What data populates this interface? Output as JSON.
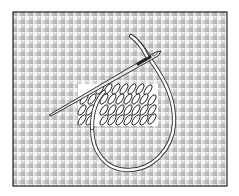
{
  "illustration": {
    "title": "Needlepoint tent stitch on canvas",
    "subject": "needle-and-thread-stitching-canvas",
    "colors": {
      "background": "#ffffff",
      "canvas_fill": "#f4f4f4",
      "mesh_line": "#8a8a8a",
      "border": "#222222",
      "stitch_fill": "#ffffff",
      "stitch_stroke": "#111111",
      "thread_fill": "#ffffff",
      "thread_stroke": "#333333",
      "needle_fill": "#e8e8e8",
      "needle_stroke": "#222222"
    },
    "canvas": {
      "x": 13,
      "y": 12,
      "width": 214,
      "height": 174,
      "mesh_pitch": 8
    },
    "stitch_block": {
      "x": 78,
      "y": 84,
      "width": 80,
      "height": 42,
      "rows": 4,
      "cols": 9
    },
    "needle": {
      "tip": [
        49,
        115
      ],
      "eye_end": [
        160,
        52
      ]
    }
  }
}
